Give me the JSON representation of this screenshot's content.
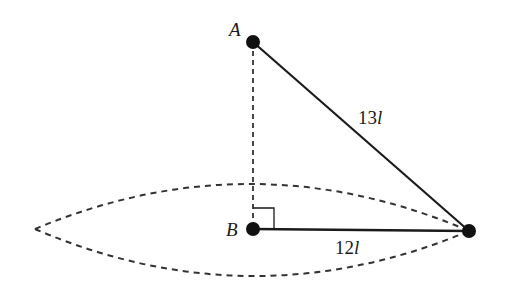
{
  "diagram": {
    "points": {
      "A": {
        "label": "A"
      },
      "B": {
        "label": "B"
      },
      "C": {
        "label": ""
      }
    },
    "segments": {
      "AC": {
        "label_num": "13",
        "label_var": "l",
        "style": "solid"
      },
      "BC": {
        "label_num": "12",
        "label_var": "l",
        "style": "solid"
      },
      "AB": {
        "style": "dashed"
      }
    },
    "right_angle_at": "B",
    "lens": {
      "style": "dashed"
    },
    "colors": {
      "stroke": "#1a1a1a",
      "dash": "#333333",
      "background": "#ffffff"
    }
  }
}
